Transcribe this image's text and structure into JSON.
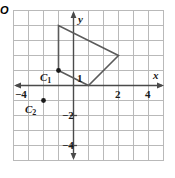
{
  "figure": {
    "background_color": "#ffffff",
    "grid_color": "#b9b9b9",
    "axis_color": "#4a4a4a",
    "shape_color": "#5a5a5a",
    "label_color": "#1a1a1a"
  },
  "axes": {
    "x_label": "x",
    "y_label": "y",
    "origin_label": "O",
    "x_range": [
      -5,
      5
    ],
    "y_range": [
      -5,
      5
    ],
    "grid": true,
    "x_ticks": [
      {
        "value": -4,
        "label": "−4"
      },
      {
        "value": 2,
        "label": "2"
      },
      {
        "value": 4,
        "label": "4"
      }
    ],
    "y_ticks": [
      {
        "value": 1,
        "label": "1"
      },
      {
        "value": -2,
        "label": "−2"
      },
      {
        "value": -4,
        "label": "−4"
      }
    ]
  },
  "shape": {
    "name": "quadrilateral",
    "vertices": [
      {
        "x": -1,
        "y": 1
      },
      {
        "x": -1,
        "y": 4
      },
      {
        "x": 3,
        "y": 2
      },
      {
        "x": 1,
        "y": 0
      }
    ],
    "closed": true,
    "stroke_width": 1.6
  },
  "points": [
    {
      "id": "c1",
      "label": "C",
      "subscript": "1",
      "x": -1,
      "y": 1,
      "label_offset_x": -18,
      "label_offset_y": 3
    },
    {
      "id": "c2",
      "label": "C",
      "subscript": "2",
      "x": -2,
      "y": -1,
      "label_offset_x": -18,
      "label_offset_y": 4
    }
  ]
}
